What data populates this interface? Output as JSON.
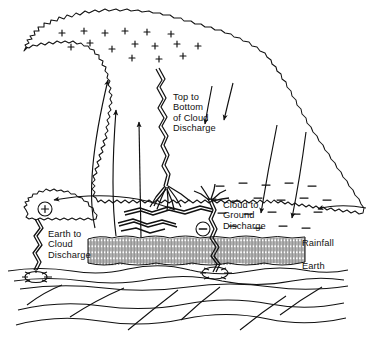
{
  "figure": {
    "background_color": "#ffffff",
    "ink_color": "#111111"
  },
  "labels": {
    "top_to_bottom_discharge": "Top to\nBottom\nof Cloud\nDischarge",
    "cloud_to_ground_discharge": "Cloud to\nGround\nDischarge",
    "earth_to_cloud_discharge": "Earth to\nCloud\nDischarge",
    "rainfall": "Rainfall",
    "earth": "Earth"
  },
  "charge_markers": {
    "positive_symbol": "+",
    "negative_symbol": "−",
    "circled_positive_label": "+",
    "circled_negative_label": "−",
    "positive_region_description": "upper cloud positive charge",
    "negative_region_description": "lower cloud negative charge",
    "positive_signs": [
      {
        "x": 62,
        "y": 33
      },
      {
        "x": 84,
        "y": 31
      },
      {
        "x": 105,
        "y": 33
      },
      {
        "x": 125,
        "y": 31
      },
      {
        "x": 147,
        "y": 32
      },
      {
        "x": 171,
        "y": 34
      },
      {
        "x": 71,
        "y": 47
      },
      {
        "x": 90,
        "y": 43
      },
      {
        "x": 112,
        "y": 49
      },
      {
        "x": 135,
        "y": 44
      },
      {
        "x": 155,
        "y": 46
      },
      {
        "x": 177,
        "y": 44
      },
      {
        "x": 198,
        "y": 46
      },
      {
        "x": 132,
        "y": 58
      },
      {
        "x": 159,
        "y": 59
      },
      {
        "x": 183,
        "y": 56
      }
    ],
    "negative_signs": [
      {
        "x": 220,
        "y": 186
      },
      {
        "x": 243,
        "y": 183
      },
      {
        "x": 266,
        "y": 185
      },
      {
        "x": 289,
        "y": 183
      },
      {
        "x": 312,
        "y": 186
      },
      {
        "x": 212,
        "y": 199
      },
      {
        "x": 236,
        "y": 201
      },
      {
        "x": 258,
        "y": 198
      },
      {
        "x": 281,
        "y": 200
      },
      {
        "x": 304,
        "y": 198
      },
      {
        "x": 327,
        "y": 200
      },
      {
        "x": 222,
        "y": 213
      },
      {
        "x": 248,
        "y": 214
      },
      {
        "x": 272,
        "y": 212
      },
      {
        "x": 296,
        "y": 214
      },
      {
        "x": 318,
        "y": 212
      },
      {
        "x": 233,
        "y": 226
      },
      {
        "x": 258,
        "y": 228
      },
      {
        "x": 283,
        "y": 226
      },
      {
        "x": 306,
        "y": 228
      }
    ],
    "circled_positive": {
      "x": 45,
      "y": 209,
      "r": 7
    },
    "circled_negative": {
      "x": 203,
      "y": 229,
      "r": 7
    }
  },
  "elements": {
    "main_cloud": "anvil thundercloud outline",
    "left_small_cloud": "small positively charged cloud at left",
    "rainfall_band": "hatched rainfall band beneath cloud base",
    "earth_surface": "ground line",
    "subsurface_strata": "wavy subsurface lines",
    "updraft_arrows": "three curved updraft arrows rising on the left",
    "downdraft_arrows": "curved downdraft arrows descending on the right",
    "inflow_arrow_right": "horizontal inflow arrow entering from right",
    "outflow_arrow_left": "long curved arrow toward left small cloud",
    "bolt_top_to_bottom": "intra-cloud vertical lightning with branched roots",
    "bolt_cloud_to_ground": "cloud to ground lightning strike",
    "bolt_earth_to_cloud": "earth to cloud lightning strike",
    "bolt_horizontal_streaks": "horizontal intra-cloud lightning streaks",
    "ground_burst_left": "starburst impact at left strike point",
    "ground_burst_right": "starburst impact at right strike point"
  }
}
